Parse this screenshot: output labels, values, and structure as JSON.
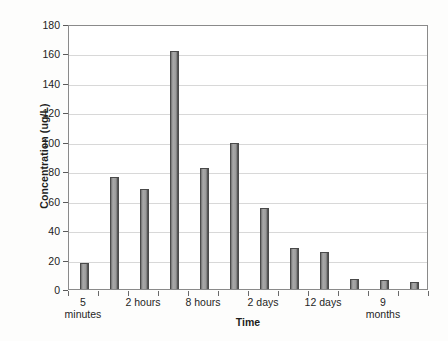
{
  "chart_data": {
    "type": "bar",
    "title": "",
    "xlabel": "Time",
    "ylabel": "Concentration (ug/L)",
    "ylim": [
      0,
      180
    ],
    "ytick_step": 20,
    "yticks": [
      0,
      20,
      40,
      60,
      80,
      100,
      120,
      140,
      160,
      180
    ],
    "grid": true,
    "legend": "none",
    "categories": [
      "5 minutes",
      "",
      "2 hours",
      "",
      "8 hours",
      "",
      "2 days",
      "",
      "12 days",
      "",
      "9 months",
      ""
    ],
    "tick_labels": [
      {
        "line1": "5",
        "line2": "minutes"
      },
      {
        "line1": "",
        "line2": ""
      },
      {
        "line1": "2 hours",
        "line2": ""
      },
      {
        "line1": "",
        "line2": ""
      },
      {
        "line1": "8 hours",
        "line2": ""
      },
      {
        "line1": "",
        "line2": ""
      },
      {
        "line1": "2 days",
        "line2": ""
      },
      {
        "line1": "",
        "line2": ""
      },
      {
        "line1": "12 days",
        "line2": ""
      },
      {
        "line1": "",
        "line2": ""
      },
      {
        "line1": "9",
        "line2": "months"
      },
      {
        "line1": "",
        "line2": ""
      }
    ],
    "values": [
      18,
      76,
      68,
      162,
      82,
      99,
      55,
      28,
      25,
      7,
      6,
      5
    ],
    "bar_color": "#9a9a9a",
    "bar_edge_color": "#4a4a4a",
    "axis_color": "#8a8a8a",
    "grid_color": "#d8d8d8"
  }
}
